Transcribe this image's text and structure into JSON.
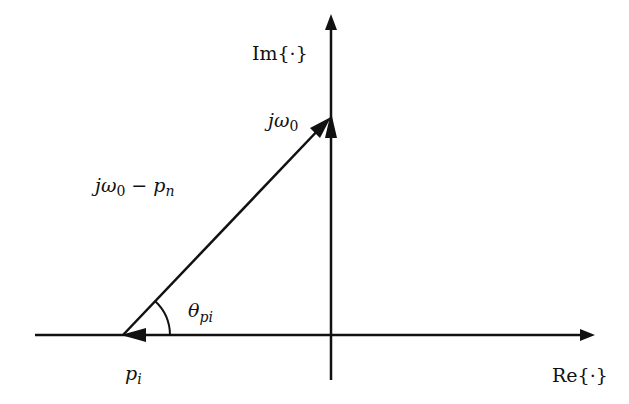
{
  "diagram": {
    "title": "",
    "axes": {
      "imag_label": "Im{·}",
      "real_label": "Re{·}"
    },
    "labels": {
      "jw0": {
        "main": "jω",
        "sub": "0"
      },
      "vector": {
        "main1": "jω",
        "sub1": "0",
        "op": " − ",
        "main2": "p",
        "sub2": "n"
      },
      "angle": {
        "main": "θ",
        "sub": "pi"
      },
      "pole": {
        "main": "p",
        "sub": "i"
      }
    },
    "colors": {
      "stroke": "#111111",
      "background": "#ffffff"
    }
  }
}
